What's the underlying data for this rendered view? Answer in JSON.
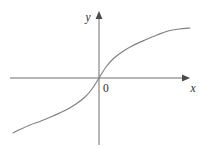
{
  "figure": {
    "background_color": "#ffffff",
    "width": 204,
    "height": 148,
    "axis_color": "#6e6e6e",
    "arrow_color": "#4a4a4a",
    "label_color": "#2a2a2a",
    "curve_color": "#808080",
    "x_axis_label": "x",
    "y_axis_label": "y",
    "origin_label": "0"
  },
  "chart_data": {
    "type": "line",
    "title": "",
    "subtitle": "",
    "xlabel": "x",
    "ylabel": "y",
    "origin_label": "0",
    "grid": false,
    "legend": null,
    "legend_position": "none",
    "axes": {
      "x_axis": {
        "orientation": "horizontal",
        "pixel_y": 78,
        "pixel_x_start": 10,
        "pixel_x_end": 190,
        "arrow": "right",
        "ticks": [],
        "tick_labels": []
      },
      "y_axis": {
        "orientation": "vertical",
        "pixel_x": 99,
        "pixel_y_start": 145,
        "pixel_y_end": 12,
        "arrow": "up",
        "ticks": [],
        "tick_labels": []
      }
    },
    "origin_pixel": [
      99,
      78
    ],
    "xlim": [
      -3.5,
      3.5
    ],
    "ylim": [
      -1.6,
      1.6
    ],
    "series": [
      {
        "name": "odd root curve",
        "description": "S-shaped odd-symmetric increasing curve through the origin, steep at the origin and flattening toward both ends",
        "color": "#808080",
        "x": [
          -3.5,
          -3.0,
          -2.5,
          -2.0,
          -1.5,
          -1.0,
          -0.6,
          -0.3,
          -0.12,
          0.0,
          0.12,
          0.3,
          0.6,
          1.0,
          1.5,
          2.0,
          2.5,
          3.0,
          3.5
        ],
        "y": [
          -1.52,
          -1.44,
          -1.36,
          -1.26,
          -1.14,
          -1.0,
          -0.84,
          -0.67,
          -0.49,
          0.0,
          0.49,
          0.67,
          0.84,
          1.0,
          1.14,
          1.26,
          1.36,
          1.44,
          1.52
        ],
        "pixel_points": [
          [
            13,
            133
          ],
          [
            21,
            129
          ],
          [
            30,
            125
          ],
          [
            41,
            121
          ],
          [
            53,
            116
          ],
          [
            66,
            110
          ],
          [
            76,
            104
          ],
          [
            85,
            97
          ],
          [
            92,
            89
          ],
          [
            99,
            78
          ],
          [
            106,
            67
          ],
          [
            113,
            59
          ],
          [
            122,
            52
          ],
          [
            132,
            46
          ],
          [
            145,
            40
          ],
          [
            157,
            35
          ],
          [
            168,
            31
          ],
          [
            179,
            29
          ],
          [
            190,
            28
          ]
        ]
      }
    ]
  }
}
